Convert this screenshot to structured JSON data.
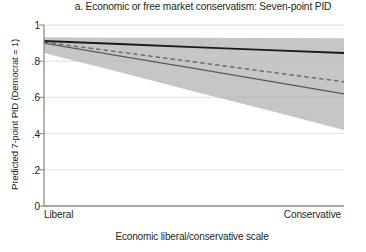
{
  "chart_data": {
    "type": "line",
    "title": "a. Economic or free market conservatism: Seven-point PID",
    "xlabel": "Economic liberal/conservative scale",
    "ylabel": "Predicted 7-point PID (Democrat = 1)",
    "xlim": [
      0,
      1
    ],
    "ylim": [
      0,
      1
    ],
    "grid": true,
    "legend_position": "none",
    "x_tick_labels": [
      "Liberal",
      "Conservative"
    ],
    "x_tick_values": [
      0,
      1
    ],
    "y_tick_labels": [
      "0",
      ".2",
      ".4",
      ".6",
      ".8",
      "1"
    ],
    "y_tick_values": [
      0,
      0.2,
      0.4,
      0.6,
      0.8,
      1
    ],
    "x": [
      0,
      0.25,
      0.5,
      0.75,
      1
    ],
    "series": [
      {
        "name": "solid-black-line",
        "style": "solid",
        "color": "#1a1a1a",
        "values": [
          0.912,
          0.895,
          0.878,
          0.861,
          0.845
        ]
      },
      {
        "name": "dashed-gray-line",
        "style": "dashed",
        "color": "#6e6e6e",
        "values": [
          0.905,
          0.851,
          0.796,
          0.741,
          0.686
        ]
      },
      {
        "name": "solid-gray-line",
        "style": "solid",
        "color": "#595959",
        "values": [
          0.9,
          0.83,
          0.76,
          0.69,
          0.62
        ]
      }
    ],
    "confidence_band": {
      "name": "confidence-interval-band",
      "color": "#b3b3b3",
      "opacity": 0.75,
      "upper": [
        0.932,
        0.93,
        0.929,
        0.928,
        0.927
      ],
      "lower": [
        0.845,
        0.74,
        0.633,
        0.527,
        0.42
      ]
    }
  }
}
